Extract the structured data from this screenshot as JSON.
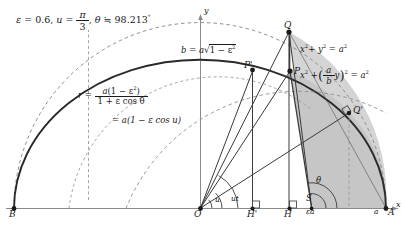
{
  "figure": {
    "type": "geometric-construction",
    "title_plain": "ε = 0.6, u = π/3, θ ≒ 98.213°",
    "title": {
      "epsilon_symbol": "ε",
      "equals": "=",
      "epsilon_value": "0.6",
      "comma1": ",",
      "u_symbol": "u",
      "u_num": "π",
      "u_den": "3",
      "comma2": ",",
      "theta_symbol": "θ",
      "approx": "≒",
      "theta_value": "98.213",
      "degree": "°"
    },
    "parameters": {
      "eccentricity": 0.6,
      "eccentric_anomaly_u": "π/3",
      "true_anomaly_theta_deg": 98.213,
      "semi_major_a": 1.0,
      "semi_minor_b": 0.8
    },
    "labels": {
      "b_formula_prefix": "b",
      "b_formula_eq": "=",
      "b_formula_a": "a",
      "b_formula_rad": "√",
      "b_formula_inner": "1 − ε",
      "b_formula_inner_sup": "2",
      "r_symbol": "r",
      "r_eq": "=",
      "r_num_a": "a",
      "r_num_paren": "(1 − ε",
      "r_num_sup": "2",
      "r_num_close": ")",
      "r_den": "1 + ε cos θ",
      "r_eq2": "=",
      "r_alt": "a(1 − ε cos u)",
      "circle_eq": "x",
      "circle_eq_sup": "2",
      "circle_eq_plus": "+ y",
      "circle_eq_sup2": "2",
      "circle_eq_rhs": "= a",
      "circle_eq_rhs_sup": "2",
      "ellipse_eq_x": "x",
      "ellipse_eq_x_sup": "2",
      "ellipse_eq_plus": "+",
      "ellipse_frac_num": "a",
      "ellipse_frac_den": "b",
      "ellipse_eq_y": "y",
      "ellipse_paren_sup": "2",
      "ellipse_eq_rhs": "= a",
      "ellipse_eq_rhs_sup": "2",
      "sector_area": "S",
      "angle_theta": "θ",
      "angle_u": "u",
      "angle_ut": "ut",
      "seg_epsilon_a": "εa",
      "seg_a": "a"
    },
    "points": [
      {
        "name": "B",
        "label": "B",
        "x": 14,
        "y": 208,
        "role": "left-vertex"
      },
      {
        "name": "O",
        "label": "O",
        "x": 200,
        "y": 208,
        "role": "center-origin"
      },
      {
        "name": "A",
        "label": "A",
        "x": 386,
        "y": 208,
        "role": "right-vertex"
      },
      {
        "name": "H-prime",
        "label": "H'",
        "x": 252,
        "y": 208,
        "role": "foot-of-P-prime"
      },
      {
        "name": "H",
        "label": "H",
        "x": 288,
        "y": 208,
        "role": "foot-of-P"
      },
      {
        "name": "Q",
        "label": "Q",
        "x": 289,
        "y": 32,
        "role": "circle-point"
      },
      {
        "name": "P",
        "label": "P",
        "x": 290,
        "y": 71,
        "role": "ellipse-point"
      },
      {
        "name": "P-prime",
        "label": "P'",
        "x": 253,
        "y": 70,
        "role": "secondary-point"
      },
      {
        "name": "Q-prime",
        "label": "Q'",
        "x": 349,
        "y": 113,
        "role": "secondary-circle-point"
      }
    ],
    "axes": {
      "x_label": "x",
      "y_label": "y"
    },
    "caption": ""
  },
  "style": {
    "ink": "#1a1a1a",
    "axis": "#7d7d7d",
    "curve": "#2a2a2a",
    "dashed": "#8c8c8c",
    "shade_a": "#d6d6d6",
    "shade_b": "#c9c9c9",
    "background": "#ffffff"
  }
}
